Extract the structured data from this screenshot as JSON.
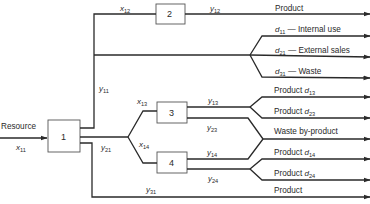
{
  "diagram": {
    "type": "resource allocation flow network",
    "nodes": [
      {
        "id": "1",
        "label": "1"
      },
      {
        "id": "2",
        "label": "2"
      },
      {
        "id": "3",
        "label": "3"
      },
      {
        "id": "4",
        "label": "4"
      }
    ],
    "input": {
      "label": "Resource",
      "var": "x",
      "sub": "11"
    },
    "flows": {
      "x12": {
        "var": "x",
        "sub": "12"
      },
      "y12": {
        "var": "y",
        "sub": "12"
      },
      "y11": {
        "var": "y",
        "sub": "11"
      },
      "y21": {
        "var": "y",
        "sub": "21"
      },
      "y31": {
        "var": "y",
        "sub": "31"
      },
      "x13": {
        "var": "x",
        "sub": "13"
      },
      "x14": {
        "var": "x",
        "sub": "14"
      },
      "y13": {
        "var": "y",
        "sub": "13"
      },
      "y23": {
        "var": "y",
        "sub": "23"
      },
      "y14": {
        "var": "y",
        "sub": "14"
      },
      "y24": {
        "var": "y",
        "sub": "24"
      }
    },
    "outputs": [
      {
        "id": "out-product-2",
        "text": "Product",
        "var": "",
        "sub": "",
        "suffix": ""
      },
      {
        "id": "out-d11",
        "text": "",
        "var": "d",
        "sub": "11",
        "suffix": " — Internal use"
      },
      {
        "id": "out-d21",
        "text": "",
        "var": "d",
        "sub": "21",
        "suffix": " — External sales"
      },
      {
        "id": "out-d31",
        "text": "",
        "var": "d",
        "sub": "31",
        "suffix": " — Waste"
      },
      {
        "id": "out-d13",
        "text": "Product ",
        "var": "d",
        "sub": "13",
        "suffix": ""
      },
      {
        "id": "out-d23",
        "text": "Product ",
        "var": "d",
        "sub": "23",
        "suffix": ""
      },
      {
        "id": "out-waste",
        "text": "Waste by-product",
        "var": "",
        "sub": "",
        "suffix": ""
      },
      {
        "id": "out-d14",
        "text": "Product ",
        "var": "d",
        "sub": "14",
        "suffix": ""
      },
      {
        "id": "out-d24",
        "text": "Product ",
        "var": "d",
        "sub": "24",
        "suffix": ""
      },
      {
        "id": "out-product-31",
        "text": "Product",
        "var": "",
        "sub": "",
        "suffix": ""
      }
    ],
    "colors": {
      "line": "#2a2a2a",
      "box_border": "#555555",
      "background": "#ffffff"
    }
  }
}
